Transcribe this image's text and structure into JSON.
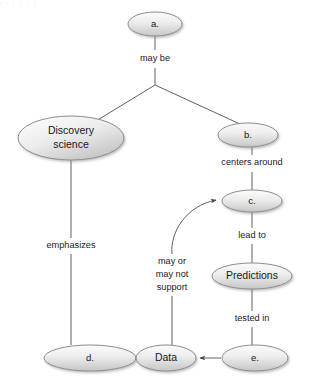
{
  "diagram": {
    "background_color": "#ffffff",
    "node_fill_light": "#f4f4f4",
    "node_fill_dark": "#c9c9c9",
    "node_stroke": "#8a8f94",
    "line_color": "#5d6166",
    "text_color": "#16191c"
  },
  "nodes": [
    {
      "id": "a",
      "label": "a.",
      "cx": 155,
      "cy": 24,
      "rx": 27,
      "ry": 12
    },
    {
      "id": "discovery",
      "label_line1": "Discovery",
      "label_line2": "science",
      "cx": 71,
      "cy": 138,
      "rx": 53,
      "ry": 22
    },
    {
      "id": "b",
      "label": "b.",
      "cx": 248,
      "cy": 135,
      "rx": 30,
      "ry": 12
    },
    {
      "id": "c",
      "label": "c.",
      "cx": 252,
      "cy": 201,
      "rx": 30,
      "ry": 11
    },
    {
      "id": "predictions",
      "label": "Predictions",
      "cx": 252,
      "cy": 276,
      "rx": 40,
      "ry": 13
    },
    {
      "id": "d",
      "label": "d.",
      "cx": 90,
      "cy": 358,
      "rx": 46,
      "ry": 13
    },
    {
      "id": "data",
      "label": "Data",
      "cx": 166,
      "cy": 358,
      "rx": 30,
      "ry": 13
    },
    {
      "id": "e",
      "label": "e.",
      "cx": 255,
      "cy": 358,
      "rx": 33,
      "ry": 13
    }
  ],
  "edge_labels": [
    {
      "id": "may-be",
      "text": "may be",
      "x": 155,
      "y": 59
    },
    {
      "id": "centers-around",
      "text": "centers around",
      "x": 252,
      "y": 163
    },
    {
      "id": "lead-to",
      "text": "lead to",
      "x": 252,
      "y": 236
    },
    {
      "id": "tested-in",
      "text": "tested in",
      "x": 252,
      "y": 319
    },
    {
      "id": "emphasizes",
      "text": "emphasizes",
      "x": 71,
      "y": 246
    },
    {
      "id": "may-or-1",
      "text": "may or",
      "x": 172,
      "y": 262
    },
    {
      "id": "may-or-2",
      "text": "may not",
      "x": 172,
      "y": 275
    },
    {
      "id": "may-or-3",
      "text": "support",
      "x": 172,
      "y": 288
    }
  ],
  "top_text": "ps ( )   ( )   .     .          .             ."
}
